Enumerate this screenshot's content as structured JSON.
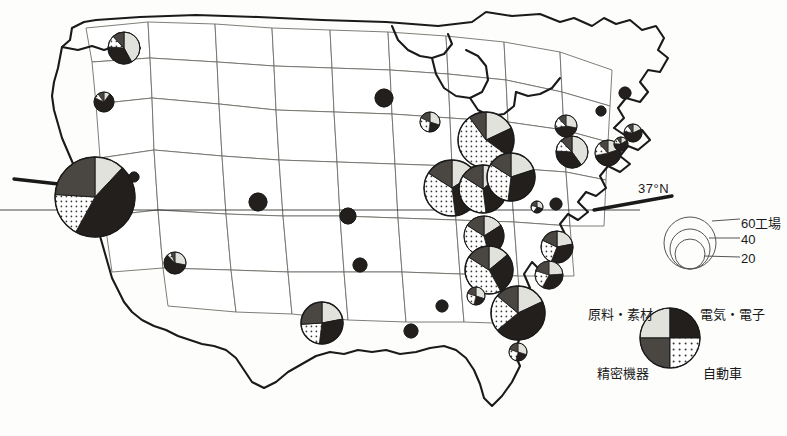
{
  "figure": {
    "type": "thematic-map",
    "region": "United States",
    "symbol": "proportional pie chart",
    "latitude_annotation": "37°N"
  },
  "annotations": {
    "latitude_label": "37°N"
  },
  "size_legend": {
    "unit_label": "60工場",
    "values": [
      "60工場",
      "40",
      "20"
    ],
    "numeric_values": [
      60,
      40,
      20
    ],
    "radii_px": [
      26,
      20,
      15
    ]
  },
  "category_legend": {
    "top_left": "原料・素材",
    "top_right": "電気・電子",
    "bottom_left": "精密機器",
    "bottom_right": "自動車",
    "colors": {
      "top_left": "#e2e2dd",
      "top_right": "#231f1c",
      "bottom_left": "#4a4743",
      "bottom_right": "#ffffff"
    }
  },
  "colors": {
    "raw_materials": "#e2e2dd",
    "electrical_electronics": "#231f1c",
    "precision_instruments": "#4a4743",
    "automobiles": "#ffffff",
    "stroke": "#1a1a1a",
    "state_border": "#6b6b66",
    "background": "#fdfdfc"
  },
  "chart_data": {
    "type": "pie",
    "title": "",
    "categories": [
      "原料・素材",
      "電気・電子",
      "自動車",
      "精密機器"
    ],
    "legend_position": "bottom-right",
    "size_encodes": "number of factories",
    "markers": [
      {
        "name": "California",
        "cx": 95,
        "cy": 197,
        "r": 40,
        "shares": [
          0.12,
          0.46,
          0.18,
          0.24
        ]
      },
      {
        "name": "Washington",
        "cx": 124,
        "cy": 48,
        "r": 16,
        "shares": [
          0.42,
          0.34,
          0.12,
          0.12
        ]
      },
      {
        "name": "Oregon",
        "cx": 104,
        "cy": 102,
        "r": 10,
        "shares": [
          0.1,
          0.72,
          0.08,
          0.1
        ]
      },
      {
        "name": "Nevada",
        "cx": 134,
        "cy": 177,
        "r": 5,
        "shares": [
          0.0,
          1.0,
          0.0,
          0.0
        ]
      },
      {
        "name": "Arizona",
        "cx": 175,
        "cy": 263,
        "r": 11,
        "shares": [
          0.28,
          0.6,
          0.06,
          0.06
        ]
      },
      {
        "name": "Colorado",
        "cx": 258,
        "cy": 202,
        "r": 9,
        "shares": [
          0.0,
          1.0,
          0.0,
          0.0
        ]
      },
      {
        "name": "Texas",
        "cx": 322,
        "cy": 323,
        "r": 21,
        "shares": [
          0.22,
          0.3,
          0.22,
          0.26
        ]
      },
      {
        "name": "Minnesota",
        "cx": 384,
        "cy": 98,
        "r": 9,
        "shares": [
          0.0,
          1.0,
          0.0,
          0.0
        ]
      },
      {
        "name": "Wisconsin",
        "cx": 430,
        "cy": 122,
        "r": 10,
        "shares": [
          0.3,
          0.22,
          0.3,
          0.18
        ]
      },
      {
        "name": "Iowa",
        "cx": 348,
        "cy": 216,
        "r": 8,
        "shares": [
          0.0,
          1.0,
          0.0,
          0.0
        ]
      },
      {
        "name": "Missouri",
        "cx": 360,
        "cy": 265,
        "r": 7,
        "shares": [
          0.0,
          1.0,
          0.0,
          0.0
        ]
      },
      {
        "name": "Michigan",
        "cx": 486,
        "cy": 140,
        "r": 28,
        "shares": [
          0.18,
          0.17,
          0.55,
          0.1
        ]
      },
      {
        "name": "Illinois",
        "cx": 452,
        "cy": 188,
        "r": 28,
        "shares": [
          0.16,
          0.32,
          0.36,
          0.16
        ]
      },
      {
        "name": "Indiana",
        "cx": 483,
        "cy": 189,
        "r": 24,
        "shares": [
          0.14,
          0.34,
          0.36,
          0.16
        ]
      },
      {
        "name": "Ohio",
        "cx": 511,
        "cy": 177,
        "r": 24,
        "shares": [
          0.2,
          0.32,
          0.32,
          0.16
        ]
      },
      {
        "name": "Kentucky",
        "cx": 484,
        "cy": 236,
        "r": 20,
        "shares": [
          0.16,
          0.3,
          0.38,
          0.16
        ]
      },
      {
        "name": "Tennessee",
        "cx": 489,
        "cy": 270,
        "r": 24,
        "shares": [
          0.14,
          0.28,
          0.42,
          0.16
        ]
      },
      {
        "name": "Pennsylvania",
        "cx": 572,
        "cy": 152,
        "r": 16,
        "shares": [
          0.4,
          0.36,
          0.12,
          0.12
        ]
      },
      {
        "name": "New York",
        "cx": 566,
        "cy": 126,
        "r": 11,
        "shares": [
          0.28,
          0.44,
          0.16,
          0.12
        ]
      },
      {
        "name": "New Jersey",
        "cx": 608,
        "cy": 153,
        "r": 13,
        "shares": [
          0.2,
          0.52,
          0.16,
          0.12
        ]
      },
      {
        "name": "Massachusetts",
        "cx": 633,
        "cy": 133,
        "r": 9,
        "shares": [
          0.18,
          0.6,
          0.12,
          0.1
        ]
      },
      {
        "name": "Connecticut",
        "cx": 621,
        "cy": 144,
        "r": 7,
        "shares": [
          0.16,
          0.6,
          0.14,
          0.1
        ]
      },
      {
        "name": "New Hampshire",
        "cx": 625,
        "cy": 93,
        "r": 6,
        "shares": [
          0.0,
          1.0,
          0.0,
          0.0
        ]
      },
      {
        "name": "Vermont",
        "cx": 601,
        "cy": 111,
        "r": 5,
        "shares": [
          0.0,
          1.0,
          0.0,
          0.0
        ]
      },
      {
        "name": "Maryland",
        "cx": 537,
        "cy": 207,
        "r": 6,
        "shares": [
          0.3,
          0.3,
          0.2,
          0.2
        ]
      },
      {
        "name": "Virginia",
        "cx": 556,
        "cy": 204,
        "r": 6,
        "shares": [
          0.0,
          1.0,
          0.0,
          0.0
        ]
      },
      {
        "name": "North Carolina",
        "cx": 557,
        "cy": 247,
        "r": 16,
        "shares": [
          0.22,
          0.34,
          0.26,
          0.18
        ]
      },
      {
        "name": "South Carolina",
        "cx": 549,
        "cy": 275,
        "r": 14,
        "shares": [
          0.24,
          0.34,
          0.22,
          0.2
        ]
      },
      {
        "name": "Georgia",
        "cx": 518,
        "cy": 313,
        "r": 27,
        "shares": [
          0.18,
          0.46,
          0.22,
          0.14
        ]
      },
      {
        "name": "Alabama",
        "cx": 442,
        "cy": 306,
        "r": 6,
        "shares": [
          0.0,
          1.0,
          0.0,
          0.0
        ]
      },
      {
        "name": "Mississippi",
        "cx": 411,
        "cy": 331,
        "r": 7,
        "shares": [
          0.0,
          1.0,
          0.0,
          0.0
        ]
      },
      {
        "name": "Arkansas",
        "cx": 476,
        "cy": 296,
        "r": 9,
        "shares": [
          0.3,
          0.24,
          0.26,
          0.2
        ]
      },
      {
        "name": "Florida",
        "cx": 518,
        "cy": 352,
        "r": 9,
        "shares": [
          0.3,
          0.24,
          0.26,
          0.2
        ]
      }
    ]
  }
}
